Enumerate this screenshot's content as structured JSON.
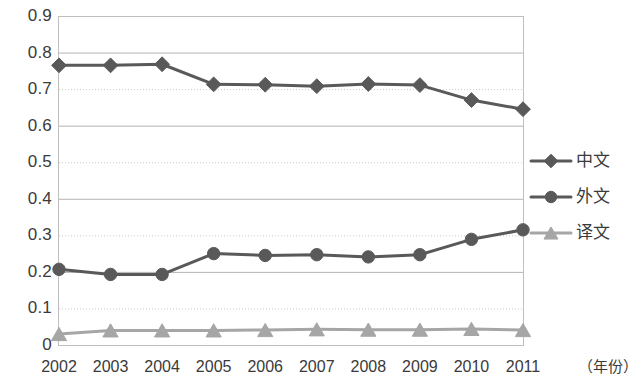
{
  "chart_data": {
    "type": "line",
    "title": "",
    "subtitle": "",
    "xlabel": "（年份）",
    "ylabel": "",
    "categories": [
      "2002",
      "2003",
      "2004",
      "2005",
      "2006",
      "2007",
      "2008",
      "2009",
      "2010",
      "2011"
    ],
    "ylim": [
      0,
      0.9
    ],
    "ytick_step": 0.1,
    "yticks": [
      "0.9",
      "0.8",
      "0.7",
      "0.6",
      "0.5",
      "0.4",
      "0.3",
      "0.2",
      "0.1",
      "0"
    ],
    "ytick_values": [
      0.9,
      0.8,
      0.7,
      0.6,
      0.5,
      0.4,
      0.3,
      0.2,
      0.1,
      0
    ],
    "grid": true,
    "grid_style": "alternating solid and dotted horizontal lines",
    "legend_position": "right",
    "series": [
      {
        "name": "中文",
        "marker": "diamond",
        "color": "#595959",
        "values": [
          0.765,
          0.765,
          0.768,
          0.713,
          0.712,
          0.708,
          0.714,
          0.711,
          0.67,
          0.645
        ]
      },
      {
        "name": "外文",
        "marker": "circle",
        "color": "#595959",
        "values": [
          0.207,
          0.193,
          0.193,
          0.25,
          0.245,
          0.247,
          0.241,
          0.247,
          0.289,
          0.315
        ]
      },
      {
        "name": "译文",
        "marker": "triangle",
        "color": "#a6a6a6",
        "values": [
          0.03,
          0.04,
          0.04,
          0.04,
          0.041,
          0.043,
          0.042,
          0.042,
          0.044,
          0.041
        ]
      }
    ]
  },
  "axes": {
    "x_axis_title": "（年份）"
  },
  "legend": {
    "items": [
      {
        "label": "中文",
        "marker": "diamond-marker-icon",
        "color": "#595959"
      },
      {
        "label": "外文",
        "marker": "circle-marker-icon",
        "color": "#595959"
      },
      {
        "label": "译文",
        "marker": "triangle-marker-icon",
        "color": "#a6a6a6"
      }
    ]
  },
  "colors": {
    "series_dark": "#595959",
    "series_light": "#a6a6a6",
    "grid_solid": "#b3b3b3",
    "grid_dotted": "#c9c9c9",
    "text": "#3a3a3a",
    "background": "#ffffff"
  }
}
